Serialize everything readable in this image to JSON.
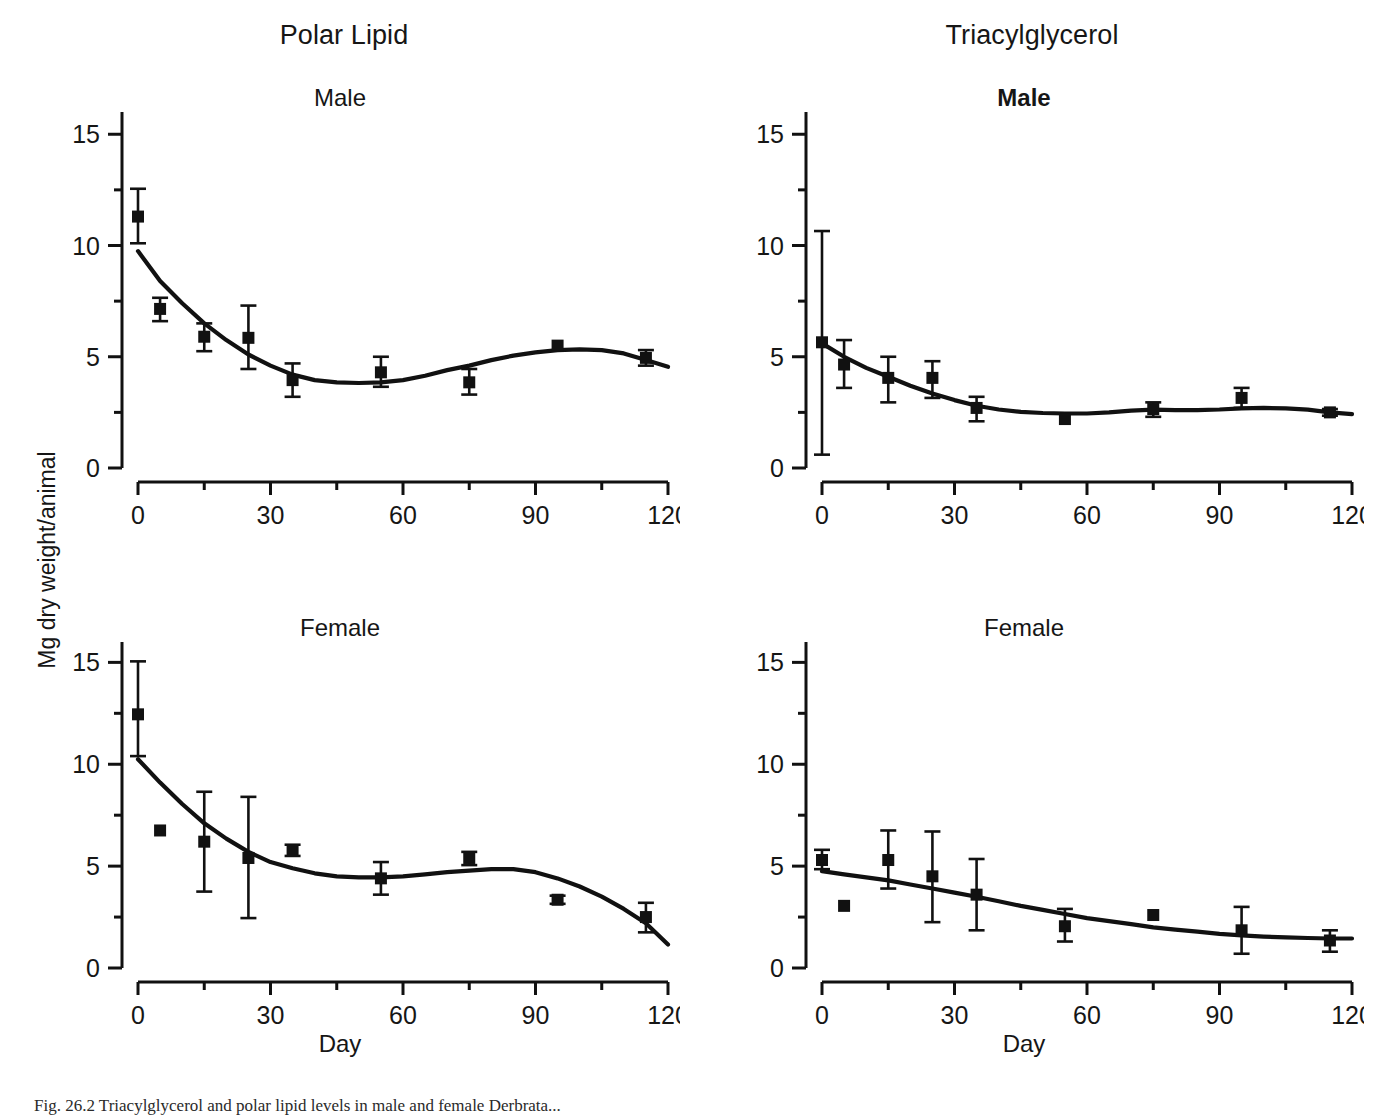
{
  "figure": {
    "column_titles": [
      "Polar Lipid",
      "Triacylglycerol"
    ],
    "y_axis_label": "Mg dry weight/animal",
    "x_axis_label": "Day",
    "caption": "Fig. 26.2 Triacylglycerol and polar lipid levels in male and female Derbrata...",
    "line_color": "#111111",
    "marker_color": "#111111",
    "background": "#ffffff"
  },
  "panels": [
    {
      "id": "tl",
      "title": "Male",
      "title_bold": false,
      "column": "Polar Lipid"
    },
    {
      "id": "tr",
      "title": "Male",
      "title_bold": true,
      "column": "Triacylglycerol"
    },
    {
      "id": "bl",
      "title": "Female",
      "title_bold": false,
      "column": "Polar Lipid"
    },
    {
      "id": "br",
      "title": "Female",
      "title_bold": false,
      "column": "Triacylglycerol"
    }
  ],
  "chart_data": [
    {
      "type": "scatter",
      "id": "polar-lipid-male",
      "title": "Male",
      "supertitle": "Polar Lipid",
      "xlabel": "Day",
      "ylabel": "Mg dry weight/animal",
      "xlim": [
        0,
        120
      ],
      "ylim": [
        0,
        16
      ],
      "xticks": [
        0,
        30,
        60,
        90,
        120
      ],
      "xticklabels": [
        "0",
        "30",
        "60",
        "90",
        "120"
      ],
      "xminorticks": [
        15,
        45,
        75,
        105
      ],
      "yticks": [
        0,
        5,
        10,
        15
      ],
      "yticklabels": [
        "0",
        "5",
        "10",
        "15"
      ],
      "yminorticks": [
        2.5,
        7.5,
        12.5
      ],
      "grid": false,
      "legend": "none",
      "x": [
        0,
        5,
        15,
        25,
        35,
        55,
        75,
        95,
        115
      ],
      "values": [
        11.3,
        7.15,
        5.9,
        5.85,
        3.95,
        4.3,
        3.85,
        5.5,
        4.95
      ],
      "err_low": [
        1.2,
        0.55,
        0.65,
        1.4,
        0.75,
        0.65,
        0.55,
        0.0,
        0.35
      ],
      "err_high": [
        1.25,
        0.5,
        0.6,
        1.45,
        0.75,
        0.7,
        0.6,
        0.0,
        0.35
      ],
      "fit_curve": [
        [
          0,
          9.75
        ],
        [
          5,
          8.4
        ],
        [
          10,
          7.4
        ],
        [
          15,
          6.5
        ],
        [
          20,
          5.75
        ],
        [
          25,
          5.1
        ],
        [
          30,
          4.6
        ],
        [
          35,
          4.2
        ],
        [
          40,
          3.95
        ],
        [
          45,
          3.85
        ],
        [
          50,
          3.82
        ],
        [
          55,
          3.85
        ],
        [
          60,
          3.95
        ],
        [
          65,
          4.15
        ],
        [
          70,
          4.4
        ],
        [
          75,
          4.6
        ],
        [
          80,
          4.85
        ],
        [
          85,
          5.05
        ],
        [
          90,
          5.2
        ],
        [
          95,
          5.3
        ],
        [
          100,
          5.33
        ],
        [
          105,
          5.3
        ],
        [
          110,
          5.15
        ],
        [
          115,
          4.85
        ],
        [
          120,
          4.55
        ]
      ]
    },
    {
      "type": "scatter",
      "id": "triacylglycerol-male",
      "title": "Male",
      "supertitle": "Triacylglycerol",
      "xlabel": "Day",
      "ylabel": "Mg dry weight/animal",
      "xlim": [
        0,
        120
      ],
      "ylim": [
        0,
        16
      ],
      "xticks": [
        0,
        30,
        60,
        90,
        120
      ],
      "xticklabels": [
        "0",
        "30",
        "60",
        "90",
        "120"
      ],
      "xminorticks": [
        15,
        45,
        75,
        105
      ],
      "yticks": [
        0,
        5,
        10,
        15
      ],
      "yticklabels": [
        "0",
        "5",
        "10",
        "15"
      ],
      "yminorticks": [
        2.5,
        7.5,
        12.5
      ],
      "grid": false,
      "legend": "none",
      "x": [
        0,
        5,
        15,
        25,
        35,
        55,
        75,
        95,
        115
      ],
      "values": [
        5.65,
        4.65,
        4.05,
        4.05,
        2.7,
        2.2,
        2.65,
        3.15,
        2.5
      ],
      "err_low": [
        5.05,
        1.05,
        1.1,
        0.9,
        0.6,
        0.0,
        0.35,
        0.45,
        0.15
      ],
      "err_high": [
        5.0,
        1.1,
        0.95,
        0.75,
        0.5,
        0.0,
        0.3,
        0.45,
        0.15
      ],
      "fit_curve": [
        [
          0,
          5.6
        ],
        [
          5,
          5.0
        ],
        [
          10,
          4.5
        ],
        [
          15,
          4.1
        ],
        [
          20,
          3.7
        ],
        [
          25,
          3.35
        ],
        [
          30,
          3.05
        ],
        [
          35,
          2.8
        ],
        [
          40,
          2.63
        ],
        [
          45,
          2.52
        ],
        [
          50,
          2.47
        ],
        [
          55,
          2.45
        ],
        [
          60,
          2.45
        ],
        [
          65,
          2.5
        ],
        [
          70,
          2.58
        ],
        [
          75,
          2.62
        ],
        [
          80,
          2.6
        ],
        [
          85,
          2.6
        ],
        [
          90,
          2.63
        ],
        [
          95,
          2.68
        ],
        [
          100,
          2.7
        ],
        [
          105,
          2.68
        ],
        [
          110,
          2.62
        ],
        [
          115,
          2.5
        ],
        [
          120,
          2.42
        ]
      ]
    },
    {
      "type": "scatter",
      "id": "polar-lipid-female",
      "title": "Female",
      "supertitle": "Polar Lipid",
      "xlabel": "Day",
      "ylabel": "Mg dry weight/animal",
      "xlim": [
        0,
        120
      ],
      "ylim": [
        0,
        16
      ],
      "xticks": [
        0,
        30,
        60,
        90,
        120
      ],
      "xticklabels": [
        "0",
        "30",
        "60",
        "90",
        "120"
      ],
      "xminorticks": [
        15,
        45,
        75,
        105
      ],
      "yticks": [
        0,
        5,
        10,
        15
      ],
      "yticklabels": [
        "0",
        "5",
        "10",
        "15"
      ],
      "yminorticks": [
        2.5,
        7.5,
        12.5
      ],
      "grid": false,
      "legend": "none",
      "x": [
        0,
        5,
        15,
        25,
        35,
        55,
        75,
        95,
        115
      ],
      "values": [
        12.45,
        6.75,
        6.2,
        5.4,
        5.75,
        4.4,
        5.4,
        3.35,
        2.5
      ],
      "err_low": [
        2.05,
        0.0,
        2.45,
        2.95,
        0.25,
        0.8,
        0.35,
        0.2,
        0.75
      ],
      "err_high": [
        2.6,
        0.0,
        2.45,
        3.0,
        0.3,
        0.8,
        0.3,
        0.2,
        0.7
      ],
      "fit_curve": [
        [
          0,
          10.25
        ],
        [
          5,
          9.1
        ],
        [
          10,
          8.05
        ],
        [
          15,
          7.1
        ],
        [
          20,
          6.35
        ],
        [
          25,
          5.7
        ],
        [
          30,
          5.2
        ],
        [
          35,
          4.9
        ],
        [
          40,
          4.65
        ],
        [
          45,
          4.5
        ],
        [
          50,
          4.45
        ],
        [
          55,
          4.45
        ],
        [
          60,
          4.5
        ],
        [
          65,
          4.6
        ],
        [
          70,
          4.7
        ],
        [
          75,
          4.78
        ],
        [
          80,
          4.85
        ],
        [
          85,
          4.85
        ],
        [
          90,
          4.7
        ],
        [
          95,
          4.4
        ],
        [
          100,
          4.0
        ],
        [
          105,
          3.5
        ],
        [
          110,
          2.9
        ],
        [
          115,
          2.2
        ],
        [
          120,
          1.15
        ]
      ]
    },
    {
      "type": "scatter",
      "id": "triacylglycerol-female",
      "title": "Female",
      "supertitle": "Triacylglycerol",
      "xlabel": "Day",
      "ylabel": "Mg dry weight/animal",
      "xlim": [
        0,
        120
      ],
      "ylim": [
        0,
        16
      ],
      "xticks": [
        0,
        30,
        60,
        90,
        120
      ],
      "xticklabels": [
        "0",
        "30",
        "60",
        "90",
        "120"
      ],
      "xminorticks": [
        15,
        45,
        75,
        105
      ],
      "yticks": [
        0,
        5,
        10,
        15
      ],
      "yticklabels": [
        "0",
        "5",
        "10",
        "15"
      ],
      "yminorticks": [
        2.5,
        7.5,
        12.5
      ],
      "grid": false,
      "legend": "none",
      "x": [
        0,
        5,
        15,
        25,
        35,
        55,
        75,
        95,
        115
      ],
      "values": [
        5.3,
        3.05,
        5.3,
        4.5,
        3.6,
        2.05,
        2.6,
        1.85,
        1.35
      ],
      "err_low": [
        0.45,
        0.0,
        1.4,
        2.25,
        1.75,
        0.75,
        0.0,
        1.15,
        0.55
      ],
      "err_high": [
        0.5,
        0.0,
        1.45,
        2.2,
        1.75,
        0.85,
        0.0,
        1.15,
        0.5
      ],
      "fit_curve": [
        [
          0,
          4.75
        ],
        [
          5,
          4.6
        ],
        [
          10,
          4.45
        ],
        [
          15,
          4.3
        ],
        [
          20,
          4.1
        ],
        [
          25,
          3.9
        ],
        [
          30,
          3.7
        ],
        [
          35,
          3.5
        ],
        [
          40,
          3.28
        ],
        [
          45,
          3.05
        ],
        [
          50,
          2.85
        ],
        [
          55,
          2.65
        ],
        [
          60,
          2.45
        ],
        [
          65,
          2.3
        ],
        [
          70,
          2.15
        ],
        [
          75,
          2.0
        ],
        [
          80,
          1.88
        ],
        [
          85,
          1.78
        ],
        [
          90,
          1.68
        ],
        [
          95,
          1.6
        ],
        [
          100,
          1.54
        ],
        [
          105,
          1.5
        ],
        [
          110,
          1.47
        ],
        [
          115,
          1.45
        ],
        [
          120,
          1.45
        ]
      ]
    }
  ]
}
